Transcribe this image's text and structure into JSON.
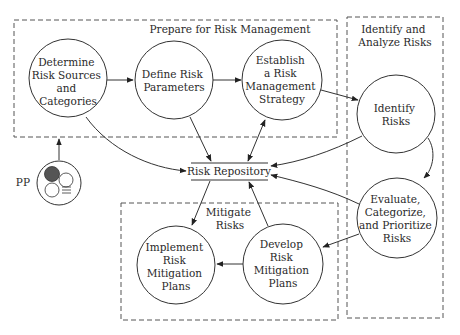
{
  "diagram": {
    "groups": [
      {
        "id": "prepare",
        "title_lines": [
          "Prepare for Risk Management"
        ]
      },
      {
        "id": "identify",
        "title_lines": [
          "Identify and",
          "Analyze Risks"
        ]
      },
      {
        "id": "mitigate",
        "title_lines": [
          "Mitigate",
          "Risks"
        ]
      }
    ],
    "nodes": {
      "determine": [
        "Determine",
        "Risk Sources",
        "and",
        "Categories"
      ],
      "define": [
        "Define Risk",
        "Parameters"
      ],
      "establish": [
        "Establish",
        "a Risk",
        "Management",
        "Strategy"
      ],
      "identify": [
        "Identify",
        "Risks"
      ],
      "evaluate": [
        "Evaluate,",
        "Categorize,",
        "and Prioritize",
        "Risks"
      ],
      "develop": [
        "Develop",
        "Risk",
        "Mitigation",
        "Plans"
      ],
      "implement": [
        "Implement",
        "Risk",
        "Mitigation",
        "Plans"
      ]
    },
    "repository": "Risk Repository",
    "pp_label": "PP",
    "edges": [
      {
        "from": "determine",
        "to": "define"
      },
      {
        "from": "define",
        "to": "establish"
      },
      {
        "from": "establish",
        "to": "identify"
      },
      {
        "from": "identify",
        "to": "evaluate"
      },
      {
        "from": "evaluate",
        "to": "develop"
      },
      {
        "from": "develop",
        "to": "implement"
      },
      {
        "from": "determine",
        "to": "repository"
      },
      {
        "from": "define",
        "to": "repository"
      },
      {
        "from": "establish",
        "to": "repository",
        "bidirectional": true
      },
      {
        "from": "identify",
        "to": "repository"
      },
      {
        "from": "evaluate",
        "to": "repository"
      },
      {
        "from": "develop",
        "to": "repository"
      },
      {
        "from": "repository",
        "to": "implement"
      },
      {
        "from": "pp",
        "to": "prepare"
      }
    ]
  }
}
